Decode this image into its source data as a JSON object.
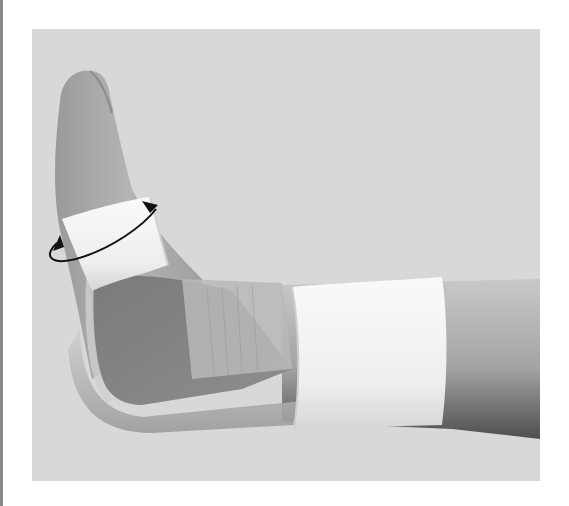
{
  "figure": {
    "description": "Lower leg and foot with a thermoplastic posterior splint secured by white adhesive tape bands around the forefoot and calf; a curved double-headed arrow indicates circumferential wrapping of the foot tape",
    "background_color": "#d8d8d8",
    "frame_bar_color": "#8a8a8a",
    "elements": {
      "foot_tape": "white tape band around midfoot",
      "calf_tape": "white tape band around lower leg",
      "splint": "translucent plastic posterior ankle splint",
      "rotation_arrow": "black elliptical double-headed arrow"
    }
  }
}
